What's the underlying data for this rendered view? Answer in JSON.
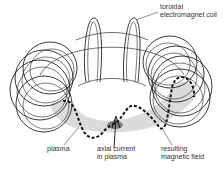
{
  "diagram": {
    "labels": {
      "coil": [
        "toroidal",
        "electromagnet coil"
      ],
      "plasma": [
        "plasma"
      ],
      "axial_current": [
        "axial current",
        "in plasma"
      ],
      "magnetic_field": [
        "resulting",
        "magnetic field"
      ]
    },
    "colors": {
      "line": "#222222",
      "plasma_fill": "#c8c8c8",
      "field_dash": "#111111",
      "text": "#333333"
    }
  }
}
